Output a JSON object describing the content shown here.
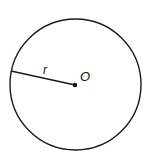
{
  "diagram": {
    "shape": "circle",
    "center_label": "O",
    "radius_label": "r",
    "stroke_color": "#1a1a1a",
    "background": "#ffffff"
  }
}
